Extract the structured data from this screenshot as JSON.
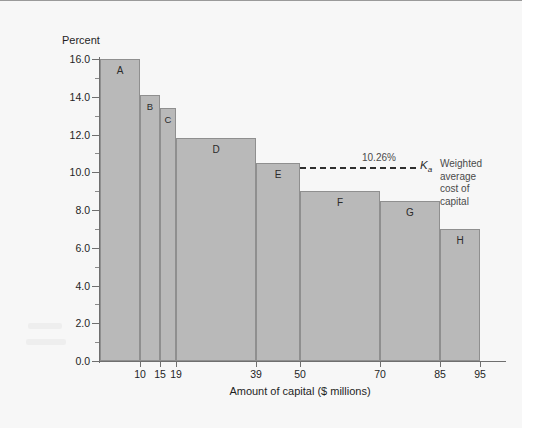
{
  "figure": {
    "y_axis_title": "Percent",
    "x_axis_title": "Amount of capital ($ millions)"
  },
  "wacc": {
    "value_label": "10.26%",
    "symbol": "K",
    "symbol_sub": "a",
    "caption_lines": [
      "Weighted",
      "average",
      "cost of",
      "capital"
    ],
    "value": 10.26
  },
  "colors": {
    "bar_fill": "#b9b9b9",
    "bar_stroke": "#8f8f8f",
    "axis": "#6f6f6f",
    "wacc_line": "#2f2f2f",
    "panel_bg": "#f7f7f7"
  },
  "chart_data": {
    "type": "bar",
    "title": "",
    "subtitle": "",
    "xlabel": "Amount of capital ($ millions)",
    "ylabel": "Percent",
    "xlim": [
      0,
      100
    ],
    "ylim": [
      0,
      16
    ],
    "grid": false,
    "legend": "none",
    "y_ticks_major": [
      "0.0",
      "2.0",
      "4.0",
      "6.0",
      "8.0",
      "10.0",
      "12.0",
      "14.0",
      "16.0"
    ],
    "y_tick_values": [
      0,
      2,
      4,
      6,
      8,
      10,
      12,
      14,
      16
    ],
    "y_minor_tick_values": [
      1,
      3,
      5,
      7,
      9,
      11,
      13,
      15
    ],
    "x_ticks": [
      "10",
      "15",
      "19",
      "39",
      "50",
      "70",
      "85",
      "95"
    ],
    "x_tick_values": [
      10,
      15,
      19,
      39,
      50,
      70,
      85,
      95
    ],
    "categories": [
      "A",
      "B",
      "C",
      "D",
      "E",
      "F",
      "G",
      "H"
    ],
    "values": [
      16.0,
      14.1,
      13.4,
      11.8,
      10.5,
      9.0,
      8.5,
      7.0
    ],
    "bars": [
      {
        "label": "A",
        "x_start": 0,
        "x_end": 10,
        "value": 16.0
      },
      {
        "label": "B",
        "x_start": 10,
        "x_end": 15,
        "value": 14.1
      },
      {
        "label": "C",
        "x_start": 15,
        "x_end": 19,
        "value": 13.4
      },
      {
        "label": "D",
        "x_start": 19,
        "x_end": 39,
        "value": 11.8
      },
      {
        "label": "E",
        "x_start": 39,
        "x_end": 50,
        "value": 10.5
      },
      {
        "label": "F",
        "x_start": 50,
        "x_end": 70,
        "value": 9.0
      },
      {
        "label": "G",
        "x_start": 70,
        "x_end": 85,
        "value": 8.5
      },
      {
        "label": "H",
        "x_start": 85,
        "x_end": 95,
        "value": 7.0
      }
    ],
    "annotations": [
      {
        "type": "hline",
        "value": 10.26,
        "label": "10.26%",
        "symbol": "Ka",
        "text": "Weighted average cost of capital",
        "style": "dashed"
      }
    ]
  }
}
